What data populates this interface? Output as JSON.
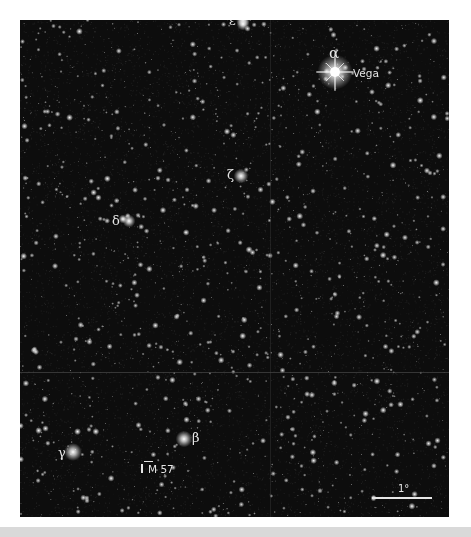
{
  "figure": {
    "sky_background": "#0d0d0d",
    "label_color": "#e6e6e6",
    "page_background": "#ffffff",
    "bottom_band_color": "#d9d9d9",
    "sky_box": {
      "x": 20,
      "y": 20,
      "w": 429,
      "h": 497
    },
    "seams": {
      "horizontal_y": 352,
      "vertical_x": 250
    },
    "field_seed": 57,
    "field_star_count": 1600
  },
  "bright_stars": [
    {
      "name": "epsilon",
      "x": 223,
      "y": 0,
      "r": 2.2
    },
    {
      "name": "epsilon-b",
      "x": 223,
      "y": 4,
      "r": 2.0
    },
    {
      "name": "vega",
      "x": 315,
      "y": 52,
      "r": 5.5,
      "spikes": true
    },
    {
      "name": "zeta",
      "x": 221,
      "y": 156,
      "r": 2.3
    },
    {
      "name": "delta",
      "x": 109,
      "y": 201,
      "r": 2.0
    },
    {
      "name": "delta-b",
      "x": 103,
      "y": 199,
      "r": 1.4
    },
    {
      "name": "beta",
      "x": 164,
      "y": 419,
      "r": 2.6
    },
    {
      "name": "gamma",
      "x": 53,
      "y": 432,
      "r": 2.8
    }
  ],
  "labels": [
    {
      "id": "epsilon-label",
      "text": "ε",
      "x": 209,
      "y": -6,
      "kind": "greek"
    },
    {
      "id": "alpha-label",
      "text": "α",
      "x": 309,
      "y": 26,
      "kind": "alpha"
    },
    {
      "id": "vega-label",
      "text": "Vega",
      "x": 333,
      "y": 48,
      "kind": "sans"
    },
    {
      "id": "zeta-label",
      "text": "ζ",
      "x": 207,
      "y": 148,
      "kind": "greek"
    },
    {
      "id": "delta-label",
      "text": "δ",
      "x": 92,
      "y": 194,
      "kind": "greek"
    },
    {
      "id": "beta-label",
      "text": "β",
      "x": 172,
      "y": 411,
      "kind": "greek"
    },
    {
      "id": "gamma-label",
      "text": "γ",
      "x": 38,
      "y": 426,
      "kind": "greek"
    },
    {
      "id": "m57-label",
      "text": "M 57",
      "x": 128,
      "y": 444,
      "kind": "sans"
    }
  ],
  "m57": {
    "marker_x": 121,
    "marker_y": 444,
    "bar_x": 124,
    "bar_y": 441,
    "bar_w": 9
  },
  "scale_bar": {
    "label": "1°",
    "x": 352,
    "y": 477,
    "width": 60,
    "label_x": 378,
    "label_y": 464
  }
}
